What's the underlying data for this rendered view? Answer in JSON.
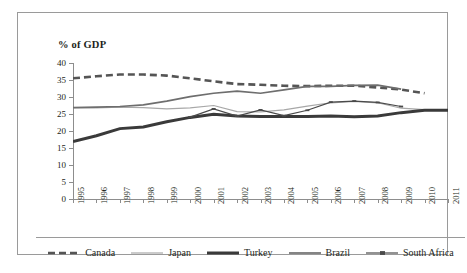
{
  "chart_data": {
    "type": "line",
    "title": "% of GDP",
    "xlabel": "",
    "ylabel": "",
    "ylim": [
      0,
      40
    ],
    "ytick_values": [
      0,
      5,
      10,
      15,
      20,
      25,
      30,
      35,
      40
    ],
    "ytick_labels": [
      "0",
      "5",
      "10",
      "15",
      "20",
      "25",
      "30",
      "35",
      "40"
    ],
    "grid": false,
    "legend_position": "bottom",
    "x": [
      1995,
      1996,
      1997,
      1998,
      1999,
      2000,
      2001,
      2002,
      2003,
      2004,
      2005,
      2006,
      2007,
      2008,
      2009,
      2010,
      2011
    ],
    "categories": [
      "1995",
      "1996",
      "1997",
      "1998",
      "1999",
      "2000",
      "2001",
      "2002",
      "2003",
      "2004",
      "2005",
      "2006",
      "2007",
      "2008",
      "2009",
      "2010",
      "2011"
    ],
    "series": [
      {
        "name": "Canada",
        "color": "#555555",
        "style": "dashed",
        "width": 2.6,
        "marker": "none",
        "values": [
          35.5,
          36.1,
          36.6,
          36.6,
          36.3,
          35.5,
          34.6,
          33.8,
          33.6,
          33.3,
          33.2,
          33.3,
          33.3,
          32.8,
          32.2,
          31.1,
          null
        ]
      },
      {
        "name": "Japan",
        "color": "#a8a8a8",
        "style": "solid",
        "width": 1.2,
        "marker": "none",
        "values": [
          26.9,
          26.8,
          27.0,
          26.9,
          26.5,
          26.8,
          27.5,
          25.7,
          25.6,
          26.2,
          27.3,
          28.3,
          28.7,
          28.3,
          26.7,
          26.3,
          26.2
        ]
      },
      {
        "name": "Turkey",
        "color": "#3a3a3a",
        "style": "solid",
        "width": 3.0,
        "marker": "none",
        "values": [
          16.9,
          18.6,
          20.7,
          21.2,
          22.7,
          24.0,
          24.9,
          24.4,
          24.3,
          24.3,
          24.3,
          24.4,
          24.2,
          24.4,
          25.4,
          26.1,
          26.1
        ]
      },
      {
        "name": "Brazil",
        "color": "#6e6e6e",
        "style": "solid",
        "width": 1.7,
        "marker": "none",
        "values": [
          26.9,
          27.0,
          27.2,
          27.7,
          28.8,
          30.1,
          31.1,
          31.7,
          31.1,
          32.1,
          33.1,
          33.1,
          33.4,
          33.5,
          32.3,
          null,
          null
        ]
      },
      {
        "name": "South Africa",
        "color": "#4a4a4a",
        "style": "solid",
        "width": 1.2,
        "marker": "dash",
        "values": [
          null,
          null,
          null,
          null,
          null,
          24.1,
          26.5,
          24.4,
          26.2,
          24.5,
          26.1,
          28.5,
          28.8,
          28.4,
          27.2,
          null,
          null
        ]
      }
    ]
  },
  "legend": {
    "items": [
      {
        "label": "Canada"
      },
      {
        "label": "Japan"
      },
      {
        "label": "Turkey"
      },
      {
        "label": "Brazil"
      },
      {
        "label": "South Africa"
      }
    ]
  }
}
